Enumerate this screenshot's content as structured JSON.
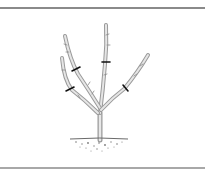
{
  "figure": {
    "colors": {
      "frame_top": "#8a8a8a",
      "frame_bottom": "#a8a8a8",
      "branch_stroke": "#9a9a9a",
      "branch_fill": "#e6e6e6",
      "cut_mark": "#111111",
      "soil": "#7a7a7a"
    },
    "cut_marks": [
      {
        "x": 76,
        "y": 69
      },
      {
        "x": 70,
        "y": 89
      },
      {
        "x": 106,
        "y": 62
      },
      {
        "x": 126,
        "y": 88
      }
    ]
  }
}
